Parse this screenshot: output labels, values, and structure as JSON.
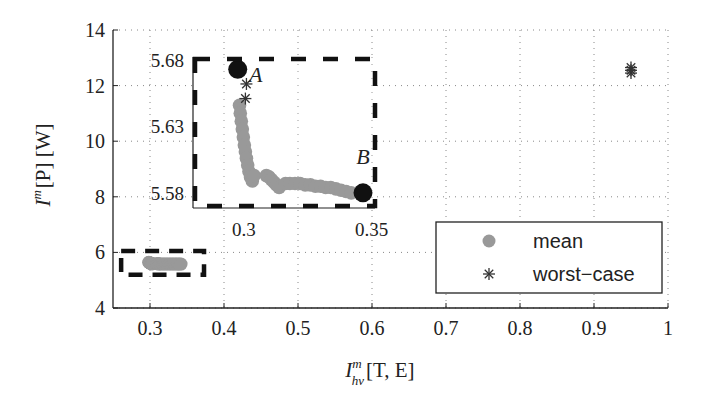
{
  "chart_data": {
    "type": "scatter",
    "title": "",
    "xlabel": "I_hv^m[T, E]",
    "ylabel": "I^m[P] [W]",
    "xlabel_parts": {
      "base": "I",
      "sup": "m",
      "sub": "hv",
      "rest": "[T, E]"
    },
    "ylabel_parts": {
      "base": "I",
      "sup": "m",
      "rest": "[P] [W]"
    },
    "xlim": [
      0.25,
      1.0
    ],
    "ylim": [
      4,
      14
    ],
    "xticks": [
      0.3,
      0.4,
      0.5,
      0.6,
      0.7,
      0.8,
      0.9,
      1
    ],
    "xtick_labels": [
      "0.3",
      "0.4",
      "0.5",
      "0.6",
      "0.7",
      "0.8",
      "0.9",
      "1"
    ],
    "yticks": [
      4,
      6,
      8,
      10,
      12,
      14
    ],
    "ytick_labels": [
      "4",
      "6",
      "8",
      "10",
      "12",
      "14"
    ],
    "grid": true,
    "legend_position": "lower right",
    "legend": [
      {
        "label": "mean",
        "marker": "circle",
        "color": "#999999"
      },
      {
        "label": "worst−case",
        "marker": "asterisk",
        "color": "#333333"
      }
    ],
    "series": [
      {
        "name": "mean",
        "marker": "circle",
        "color": "#999999",
        "x": [
          0.2983,
          0.2986,
          0.299,
          0.2994,
          0.2998,
          0.3002,
          0.3006,
          0.301,
          0.3015,
          0.302,
          0.3026,
          0.3033,
          0.304,
          0.3088,
          0.3098,
          0.3108,
          0.3118,
          0.3128,
          0.3138,
          0.3163,
          0.318,
          0.32,
          0.322,
          0.324,
          0.326,
          0.328,
          0.33,
          0.332,
          0.334,
          0.336,
          0.338,
          0.34,
          0.342
        ],
        "y": [
          5.646,
          5.64,
          5.634,
          5.628,
          5.622,
          5.616,
          5.611,
          5.606,
          5.601,
          5.596,
          5.592,
          5.589,
          5.593,
          5.593,
          5.592,
          5.59,
          5.588,
          5.586,
          5.584,
          5.587,
          5.587,
          5.587,
          5.587,
          5.586,
          5.586,
          5.585,
          5.585,
          5.584,
          5.584,
          5.583,
          5.582,
          5.581,
          5.58
        ]
      },
      {
        "name": "worst-case",
        "marker": "asterisk",
        "color": "#333333",
        "x": [
          0.301,
          0.3006,
          0.95,
          0.95,
          0.95
        ],
        "y": [
          5.662,
          5.651,
          12.45,
          12.55,
          12.65
        ]
      },
      {
        "name": "extremes",
        "marker": "large-circle",
        "color": "#111111",
        "x": [
          0.2976,
          0.3466
        ],
        "y": [
          5.673,
          5.58
        ],
        "labels": [
          "A",
          "B"
        ]
      }
    ],
    "annotations": [
      {
        "text": "A",
        "x": 0.302,
        "y": 5.665
      },
      {
        "text": "B",
        "x": 0.344,
        "y": 5.594
      },
      {
        "text": "dashed zoom box (main)",
        "x": [
          0.261,
          0.373
        ],
        "y": [
          5.2,
          6.05
        ]
      }
    ],
    "inset": {
      "xlim": [
        0.2801,
        0.3513
      ],
      "ylim": [
        5.5686,
        5.6823
      ],
      "xticks": [
        0.3,
        0.35
      ],
      "xtick_labels": [
        "0.3",
        "0.35"
      ],
      "yticks": [
        5.58,
        5.63,
        5.68
      ],
      "ytick_labels": [
        "5.58",
        "5.63",
        "5.68"
      ]
    }
  },
  "legend": {
    "mean_label": "mean",
    "worst_label": "worst−case"
  },
  "labels": {
    "point_a": "A",
    "point_b": "B"
  }
}
